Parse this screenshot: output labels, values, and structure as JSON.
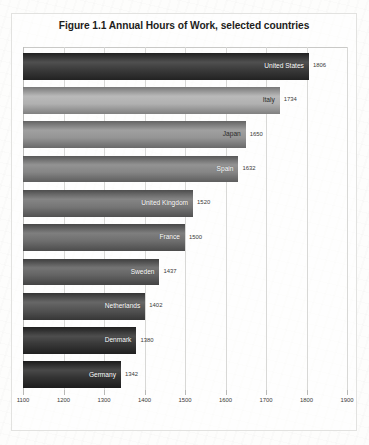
{
  "chart_data": {
    "type": "bar",
    "orientation": "horizontal",
    "title": "Figure 1.1 Annual Hours of Work, selected countries",
    "xlabel": "",
    "ylabel": "",
    "xlim": [
      1100,
      1900
    ],
    "xticks": [
      1100,
      1200,
      1300,
      1400,
      1500,
      1600,
      1700,
      1800,
      1900
    ],
    "xtick_labels": [
      "1100",
      "1200",
      "1300",
      "1400",
      "1500",
      "1600",
      "1700",
      "1800",
      "1900"
    ],
    "grid": true,
    "legend": false,
    "categories": [
      "United States",
      "Italy",
      "Japan",
      "Spain",
      "United Kingdom",
      "France",
      "Sweden",
      "Netherlands",
      "Denmark",
      "Germany"
    ],
    "values": [
      1806,
      1734,
      1650,
      1632,
      1520,
      1500,
      1437,
      1402,
      1380,
      1342
    ],
    "value_labels": [
      "1806",
      "1734",
      "1650",
      "1632",
      "1520",
      "1500",
      "1437",
      "1402",
      "1380",
      "1342"
    ],
    "bars": [
      {
        "label": "United States",
        "value": 1806,
        "value_label": "1806",
        "color": "#2e2e2e",
        "tone": "dark"
      },
      {
        "label": "Italy",
        "value": 1734,
        "value_label": "1734",
        "color": "#acacac",
        "tone": "light"
      },
      {
        "label": "Japan",
        "value": 1650,
        "value_label": "1650",
        "color": "#8e8e8e",
        "tone": "light"
      },
      {
        "label": "Spain",
        "value": 1632,
        "value_label": "1632",
        "color": "#7e7e7e",
        "tone": "dark"
      },
      {
        "label": "United Kingdom",
        "value": 1520,
        "value_label": "1520",
        "color": "#6e6e6e",
        "tone": "dark"
      },
      {
        "label": "France",
        "value": 1500,
        "value_label": "1500",
        "color": "#666666",
        "tone": "dark"
      },
      {
        "label": "Sweden",
        "value": 1437,
        "value_label": "1437",
        "color": "#5a5a5a",
        "tone": "dark"
      },
      {
        "label": "Netherlands",
        "value": 1402,
        "value_label": "1402",
        "color": "#4a4a4a",
        "tone": "dark"
      },
      {
        "label": "Denmark",
        "value": 1380,
        "value_label": "1380",
        "color": "#2c2c2c",
        "tone": "dark"
      },
      {
        "label": "Germany",
        "value": 1342,
        "value_label": "1342",
        "color": "#262626",
        "tone": "dark"
      }
    ]
  },
  "colors": {
    "frame_border": "#e2e2e0",
    "gridline": "#d8d8d6",
    "page_background": "#fdfdfc",
    "title_text": "#1d1d1b",
    "tick_text": "#3a3a38"
  }
}
